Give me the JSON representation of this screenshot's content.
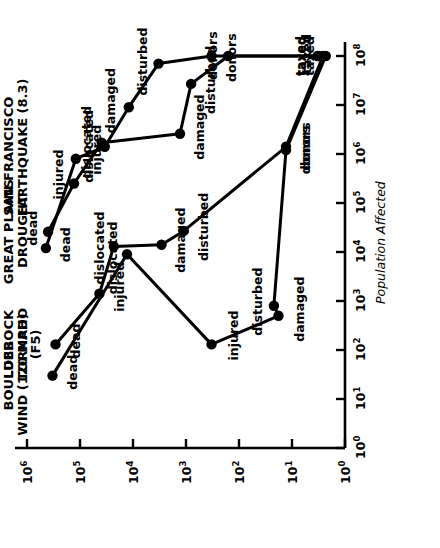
{
  "chart_data": {
    "type": "scatter",
    "title": "",
    "xlabel": "Population Affected",
    "ylabel": "Per Capita Costs & Losses",
    "xscale": "log",
    "yscale": "log",
    "xlim": [
      1,
      100000000
    ],
    "ylim": [
      1,
      1000000
    ],
    "xticklabels": [
      "10^0",
      "10^1",
      "10^2",
      "10^3",
      "10^4",
      "10^5",
      "10^6",
      "10^7",
      "10^8"
    ],
    "yticklabels": [
      "10^0",
      "10^1",
      "10^2",
      "10^3",
      "10^4",
      "10^5",
      "10^6"
    ],
    "xtick_exponents": [
      0,
      1,
      2,
      3,
      4,
      5,
      6,
      7,
      8
    ],
    "ytick_exponents": [
      0,
      1,
      2,
      3,
      4,
      5,
      6
    ],
    "grid": false,
    "legend": "inline-labels",
    "marker": "filled-circle",
    "series": [
      {
        "name": "BOULDER WIND (120 MPH)",
        "title_line1": "BOULDER",
        "title_line2": "WIND (120 MPH)",
        "points": [
          {
            "label": "dead",
            "x": 30,
            "y": 330000
          },
          {
            "label": "dislocated",
            "x": 9000,
            "y": 13000
          },
          {
            "label": "injured",
            "x": 130,
            "y": 330
          },
          {
            "label": "damaged",
            "x": 500,
            "y": 18
          },
          {
            "label": "disturbed",
            "x": 800,
            "y": 22
          },
          {
            "label": "donors",
            "x": 1200000,
            "y": 13
          },
          {
            "label": "taxed",
            "x": 100000000,
            "y": 2.3
          }
        ]
      },
      {
        "name": "LUBBOCK TORNADO (F5)",
        "title_line1": "LUBBOCK",
        "title_line2": "TORNADO",
        "title_line3": "(F5)",
        "points": [
          {
            "label": "dead",
            "x": 130,
            "y": 290000
          },
          {
            "label": "injured",
            "x": 1400,
            "y": 43000
          },
          {
            "label": "dislocated",
            "x": 13000,
            "y": 23000
          },
          {
            "label": "damaged",
            "x": 14000,
            "y": 2900
          },
          {
            "label": "disturbed",
            "x": 27000,
            "y": 1100
          },
          {
            "label": "donors",
            "x": 1400000,
            "y": 13
          },
          {
            "label": "taxed",
            "x": 100000000,
            "y": 2.6
          }
        ]
      },
      {
        "name": "GREAT PLAINS DROUGHT",
        "title_line1": "GREAT PLAINS",
        "title_line2": "DROUGHT",
        "points": [
          {
            "label": "dead",
            "x": 26000,
            "y": 400000
          },
          {
            "label": "injured",
            "x": 250000,
            "y": 130000
          },
          {
            "label": "dislocated",
            "x": 1700000,
            "y": 39000
          },
          {
            "label": "damaged",
            "x": 2600000,
            "y": 1300
          },
          {
            "label": "disturbed",
            "x": 27000000,
            "y": 800
          },
          {
            "label": "donors",
            "x": 100000000,
            "y": 160
          },
          {
            "label": "taxed",
            "x": 100000000,
            "y": 3.3
          }
        ]
      },
      {
        "name": "SAN FRANCISCO EARTHQUAKE (8.3)",
        "title_line1": "SAN FRANCISCO",
        "title_line2": "EARTHQUAKE (8.3)",
        "points": [
          {
            "label": "dead",
            "x": 12000,
            "y": 440000
          },
          {
            "label": "injured",
            "x": 800000,
            "y": 120000
          },
          {
            "label": "dislocated",
            "x": 1400000,
            "y": 34000
          },
          {
            "label": "damaged",
            "x": 9000000,
            "y": 12000
          },
          {
            "label": "disturbed",
            "x": 70000000,
            "y": 3300
          },
          {
            "label": "donors",
            "x": 100000000,
            "y": 330
          },
          {
            "label": "taxed",
            "x": 100000000,
            "y": 3.1
          }
        ]
      }
    ]
  },
  "axes": {
    "x_title": "Population Affected",
    "y_title": "Per Capita Costs & Losses"
  }
}
